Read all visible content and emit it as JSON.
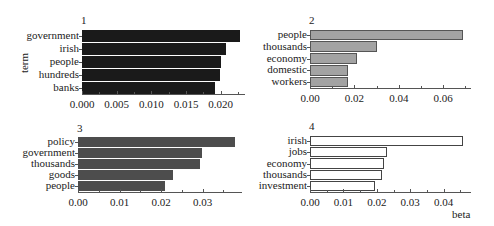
{
  "chart_data": [
    {
      "type": "bar",
      "orientation": "horizontal",
      "title": "1",
      "categories": [
        "government",
        "irish",
        "people",
        "hundreds",
        "banks"
      ],
      "values": [
        0.0228,
        0.0207,
        0.0201,
        0.0199,
        0.0192
      ],
      "xticks": [
        "0.000",
        "0.005",
        "0.010",
        "0.015",
        "0.020"
      ],
      "xtick_values": [
        0,
        0.005,
        0.01,
        0.015,
        0.02
      ],
      "xlim": [
        0,
        0.0235
      ],
      "fill": "#1a1a1a",
      "stroke": "#1a1a1a",
      "ylabel": "term",
      "xlabel": ""
    },
    {
      "type": "bar",
      "orientation": "horizontal",
      "title": "2",
      "categories": [
        "people",
        "thousands",
        "economy",
        "domestic",
        "workers"
      ],
      "values": [
        0.069,
        0.03,
        0.021,
        0.017,
        0.017
      ],
      "xticks": [
        "0.00",
        "0.02",
        "0.04",
        "0.06"
      ],
      "xtick_values": [
        0,
        0.02,
        0.04,
        0.06
      ],
      "xlim": [
        0,
        0.0725
      ],
      "fill": "#a3a3a3",
      "stroke": "#555555",
      "ylabel": "",
      "xlabel": ""
    },
    {
      "type": "bar",
      "orientation": "horizontal",
      "title": "3",
      "categories": [
        "policy",
        "government",
        "thousands",
        "goods",
        "people"
      ],
      "values": [
        0.0378,
        0.0298,
        0.0295,
        0.023,
        0.021
      ],
      "xticks": [
        "0.00",
        "0.01",
        "0.02",
        "0.03"
      ],
      "xtick_values": [
        0,
        0.01,
        0.02,
        0.03
      ],
      "xlim": [
        0,
        0.0395
      ],
      "fill": "#4d4d4d",
      "stroke": "#4d4d4d",
      "ylabel": "",
      "xlabel": ""
    },
    {
      "type": "bar",
      "orientation": "horizontal",
      "title": "4",
      "categories": [
        "irish",
        "jobs",
        "economy",
        "thousands",
        "investment"
      ],
      "values": [
        0.0457,
        0.0231,
        0.0222,
        0.0215,
        0.0195
      ],
      "xticks": [
        "0.00",
        "0.01",
        "0.02",
        "0.03",
        "0.04"
      ],
      "xtick_values": [
        0,
        0.01,
        0.02,
        0.03,
        0.04
      ],
      "xlim": [
        0,
        0.0482
      ],
      "fill": "#ffffff",
      "stroke": "#444444",
      "ylabel": "",
      "xlabel": "beta"
    }
  ],
  "layout": [
    {
      "x0": 82,
      "x1": 245,
      "ytop": 29,
      "ybot": 94,
      "title_y": 14,
      "ytitle_x": 14,
      "ytitle_y": 57
    },
    {
      "x0": 310,
      "x1": 471,
      "ytop": 29,
      "ybot": 88,
      "title_y": 14
    },
    {
      "x0": 78,
      "x1": 242,
      "ytop": 136,
      "ybot": 192,
      "title_y": 122
    },
    {
      "x0": 310,
      "x1": 471,
      "ytop": 135,
      "ybot": 192,
      "title_y": 120,
      "xtitle_x": 452,
      "xtitle_y": 208
    }
  ]
}
